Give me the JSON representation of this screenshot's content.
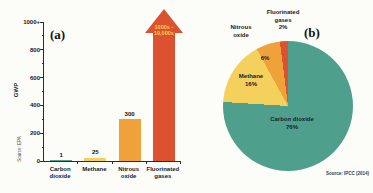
{
  "figure": {
    "panel_a_label": "(a)",
    "panel_b_label": "(b)",
    "bar_source": "Source: EPA",
    "pie_source": "Source: IPCC (2014)"
  },
  "chart_data": [
    {
      "type": "bar",
      "title": "",
      "xlabel": "",
      "ylabel": "GWP",
      "categories": [
        "Carbon dioxide",
        "Methane",
        "Nitrous oxide",
        "Fluorinated gases"
      ],
      "values": [
        1,
        25,
        300,
        10000
      ],
      "value_labels": [
        "1",
        "25",
        "300",
        "1000s -\n10,000s"
      ],
      "ylim": [
        0,
        1000
      ],
      "ytick_labels": [
        "0",
        "200",
        "400",
        "600",
        "800",
        "1000+"
      ],
      "bar_colors": [
        "#4e9f8b",
        "#f4d05c",
        "#efa23a",
        "#dc5231"
      ],
      "arrow_label_color": "#f6cf4f",
      "layout_note": "Fluorinated gases drawn as an upward arrow exceeding the axis maximum",
      "source": "Source: EPA"
    },
    {
      "type": "pie",
      "title": "",
      "labels": [
        "Carbon dioxide",
        "Methane",
        "Nitrous oxide",
        "Fluorinated gases"
      ],
      "values": [
        76,
        16,
        6,
        2
      ],
      "percent_labels": [
        "76%",
        "16%",
        "6%",
        "2%"
      ],
      "slice_colors": [
        "#4e9f8b",
        "#f4d05c",
        "#efa23a",
        "#dc5231"
      ],
      "start_angle": "12 o'clock, clockwise",
      "source": "Source: IPCC (2014)"
    }
  ]
}
